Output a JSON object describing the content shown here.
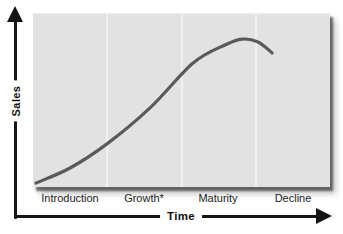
{
  "chart": {
    "y_axis_label": "Sales",
    "x_axis_label": "Time"
  },
  "chart_data": {
    "type": "line",
    "title": "",
    "xlabel": "Time",
    "ylabel": "Sales",
    "categories": [
      "Introduction",
      "Growth*",
      "Maturity",
      "Decline"
    ],
    "axes_numeric": false,
    "legend": "none",
    "grid": "three faint vertical dividers at phase boundaries (25%, 50%, 75% of time axis)",
    "series": [
      {
        "name": "Sales",
        "x_pct": [
          1.0,
          12.5,
          24.9,
          39.4,
          53.9,
          64.6,
          70.4,
          75.8,
          80.5
        ],
        "y_pct": [
          2.3,
          11.0,
          24.9,
          45.7,
          71.7,
          82.1,
          85.5,
          83.8,
          77.5
        ]
      }
    ],
    "colors": {
      "curve": "#5a5a5a",
      "plot_background": "#e2e2e2",
      "divider": "#f0f0f0",
      "axis": "#151515",
      "label_text": "#242424"
    }
  }
}
